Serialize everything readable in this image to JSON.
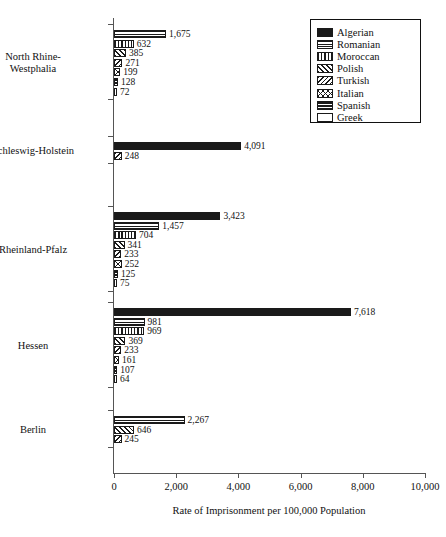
{
  "chart_data": {
    "type": "bar",
    "orientation": "horizontal",
    "title": "",
    "xlabel": "Rate of Imprisonment per 100,000 Population",
    "ylabel": "",
    "xlim": [
      0,
      10000
    ],
    "xticks": [
      0,
      2000,
      4000,
      6000,
      8000,
      10000
    ],
    "xtick_labels": [
      "0",
      "2,000",
      "4,000",
      "6,000",
      "8,000",
      "10,000"
    ],
    "grid": false,
    "legend_position": "top-right",
    "categories": [
      "North Rhine-Westphalia",
      "Schleswig-Holstein",
      "Rheinland-Pfalz",
      "Hessen",
      "Berlin"
    ],
    "series": [
      {
        "name": "Algerian",
        "pattern": "solid",
        "values": [
          null,
          4091,
          3423,
          7618,
          null
        ]
      },
      {
        "name": "Romanian",
        "pattern": "hlines",
        "values": [
          1675,
          null,
          1457,
          981,
          2267
        ]
      },
      {
        "name": "Moroccan",
        "pattern": "vlines",
        "values": [
          632,
          null,
          704,
          969,
          null
        ]
      },
      {
        "name": "Polish",
        "pattern": "dhatch",
        "values": [
          385,
          null,
          341,
          369,
          646
        ]
      },
      {
        "name": "Turkish",
        "pattern": "bhatch",
        "values": [
          271,
          248,
          233,
          233,
          245
        ]
      },
      {
        "name": "Italian",
        "pattern": "xhatch",
        "values": [
          199,
          null,
          252,
          161,
          null
        ]
      },
      {
        "name": "Spanish",
        "pattern": "thicklines",
        "values": [
          128,
          null,
          125,
          107,
          null
        ]
      },
      {
        "name": "Greek",
        "pattern": "empty",
        "values": [
          72,
          null,
          75,
          64,
          null
        ]
      }
    ],
    "groups": [
      {
        "label_lines": [
          "North Rhine-",
          "Westphalia"
        ],
        "bars": [
          {
            "series": "Romanian",
            "value": 1675,
            "label": "1,675",
            "pattern": "hlines"
          },
          {
            "series": "Moroccan",
            "value": 632,
            "label": "632",
            "pattern": "vlines"
          },
          {
            "series": "Polish",
            "value": 385,
            "label": "385",
            "pattern": "dhatch"
          },
          {
            "series": "Turkish",
            "value": 271,
            "label": "271",
            "pattern": "bhatch"
          },
          {
            "series": "Italian",
            "value": 199,
            "label": "199",
            "pattern": "xhatch"
          },
          {
            "series": "Spanish",
            "value": 128,
            "label": "128",
            "pattern": "thicklines"
          },
          {
            "series": "Greek",
            "value": 72,
            "label": "72",
            "pattern": "empty"
          }
        ]
      },
      {
        "label_lines": [
          "Schleswig-Holstein"
        ],
        "bars": [
          {
            "series": "Algerian",
            "value": 4091,
            "label": "4,091",
            "pattern": "solid"
          },
          {
            "series": "Turkish",
            "value": 248,
            "label": "248",
            "pattern": "bhatch"
          }
        ]
      },
      {
        "label_lines": [
          "Rheinland-Pfalz"
        ],
        "bars": [
          {
            "series": "Algerian",
            "value": 3423,
            "label": "3,423",
            "pattern": "solid"
          },
          {
            "series": "Romanian",
            "value": 1457,
            "label": "1,457",
            "pattern": "hlines"
          },
          {
            "series": "Moroccan",
            "value": 704,
            "label": "704",
            "pattern": "vlines"
          },
          {
            "series": "Polish",
            "value": 341,
            "label": "341",
            "pattern": "dhatch"
          },
          {
            "series": "Turkish",
            "value": 233,
            "label": "233",
            "pattern": "bhatch"
          },
          {
            "series": "Italian",
            "value": 252,
            "label": "252",
            "pattern": "xhatch"
          },
          {
            "series": "Spanish",
            "value": 125,
            "label": "125",
            "pattern": "thicklines"
          },
          {
            "series": "Greek",
            "value": 75,
            "label": "75",
            "pattern": "empty"
          }
        ]
      },
      {
        "label_lines": [
          "Hessen"
        ],
        "bars": [
          {
            "series": "Algerian",
            "value": 7618,
            "label": "7,618",
            "pattern": "solid"
          },
          {
            "series": "Romanian",
            "value": 981,
            "label": "981",
            "pattern": "hlines"
          },
          {
            "series": "Moroccan",
            "value": 969,
            "label": "969",
            "pattern": "vlines"
          },
          {
            "series": "Polish",
            "value": 369,
            "label": "369",
            "pattern": "dhatch"
          },
          {
            "series": "Turkish",
            "value": 233,
            "label": "233",
            "pattern": "bhatch"
          },
          {
            "series": "Italian",
            "value": 161,
            "label": "161",
            "pattern": "xhatch"
          },
          {
            "series": "Spanish",
            "value": 107,
            "label": "107",
            "pattern": "thicklines"
          },
          {
            "series": "Greek",
            "value": 64,
            "label": "64",
            "pattern": "empty"
          }
        ]
      },
      {
        "label_lines": [
          "Berlin"
        ],
        "bars": [
          {
            "series": "Romanian",
            "value": 2267,
            "label": "2,267",
            "pattern": "hlines"
          },
          {
            "series": "Polish",
            "value": 646,
            "label": "646",
            "pattern": "dhatch"
          },
          {
            "series": "Turkish",
            "value": 245,
            "label": "245",
            "pattern": "bhatch"
          }
        ]
      }
    ],
    "legend": [
      {
        "label": "Algerian",
        "pattern": "solid"
      },
      {
        "label": "Romanian",
        "pattern": "hlines"
      },
      {
        "label": "Moroccan",
        "pattern": "vlines"
      },
      {
        "label": "Polish",
        "pattern": "dhatch"
      },
      {
        "label": "Turkish",
        "pattern": "bhatch"
      },
      {
        "label": "Italian",
        "pattern": "xhatch"
      },
      {
        "label": "Spanish",
        "pattern": "thicklines"
      },
      {
        "label": "Greek",
        "pattern": "empty"
      }
    ]
  }
}
